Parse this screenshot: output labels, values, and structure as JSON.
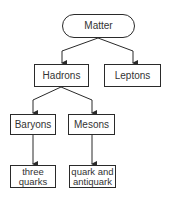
{
  "diagram": {
    "type": "hierarchy",
    "nodes": {
      "matter": "Matter",
      "hadrons": "Hadrons",
      "leptons": "Leptons",
      "baryons": "Baryons",
      "mesons": "Mesons",
      "three_quarks": "three quarks",
      "quark_antiquark": "quark and antiquark"
    },
    "edges": [
      [
        "Matter",
        "Hadrons"
      ],
      [
        "Matter",
        "Leptons"
      ],
      [
        "Hadrons",
        "Baryons"
      ],
      [
        "Hadrons",
        "Mesons"
      ],
      [
        "Baryons",
        "three quarks"
      ],
      [
        "Mesons",
        "quark and antiquark"
      ]
    ],
    "colors": {
      "stroke": "#2a2a2a",
      "text": "#333333",
      "fill": "#ffffff"
    }
  }
}
